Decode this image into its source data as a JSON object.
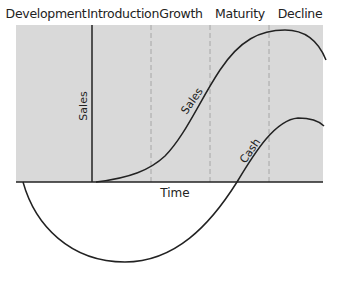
{
  "diagram": {
    "type": "product-life-cycle",
    "phases": [
      {
        "label": "Development",
        "center_x": 46
      },
      {
        "label": "Introduction",
        "center_x": 123
      },
      {
        "label": "Growth",
        "center_x": 181
      },
      {
        "label": "Maturity",
        "center_x": 240
      },
      {
        "label": "Decline",
        "center_x": 300
      }
    ],
    "x_axis_label": "Time",
    "y_axis_label": "Sales",
    "curves": [
      {
        "name": "Sales",
        "label": "Sales"
      },
      {
        "name": "Cash",
        "label": "Cash"
      }
    ],
    "colors": {
      "shaded_area": "#d9d9d9",
      "line": "#222222",
      "dashed_divider": "#a6a6a6",
      "background": "#ffffff"
    }
  }
}
